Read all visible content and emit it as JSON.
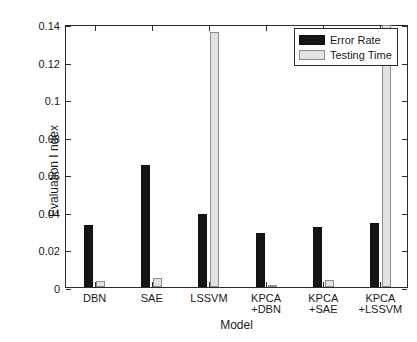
{
  "chart_data": {
    "type": "bar",
    "title": "",
    "xlabel": "Model",
    "ylabel": "Evaluation I ndex",
    "categories": [
      "DBN",
      "SAE",
      "LSSVM",
      "KPCA\n+DBN",
      "KPCA\n+SAE",
      "KPCA\n+LSSVM"
    ],
    "series": [
      {
        "name": "Error Rate",
        "color": "#151515",
        "values": [
          0.033,
          0.065,
          0.039,
          0.029,
          0.032,
          0.034
        ]
      },
      {
        "name": "Testing Time",
        "color": "#e2e2e2",
        "values": [
          0.003,
          0.005,
          0.1355,
          0.001,
          0.004,
          0.1395
        ]
      }
    ],
    "ylim": [
      0,
      0.14
    ],
    "yticks": [
      0,
      0.02,
      0.04,
      0.06,
      0.08,
      0.1,
      0.12,
      0.14
    ],
    "ytick_labels": [
      "0",
      "0.02",
      "0.04",
      "0.06",
      "0.08",
      "0.1",
      "0.12",
      "0.14"
    ],
    "grid": false,
    "legend_position": "top-right",
    "legend": [
      "Error Rate",
      "Testing Time"
    ]
  }
}
